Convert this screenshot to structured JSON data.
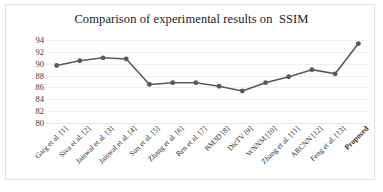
{
  "chart_data": {
    "type": "line",
    "title": "Comparison of experimental results on  SSIM",
    "xlabel": "",
    "ylabel": "",
    "ylim": [
      80,
      94
    ],
    "yticks": [
      94,
      92,
      90,
      88,
      86,
      84,
      82,
      80
    ],
    "grid": true,
    "legend": "none",
    "categories": [
      "Garg et al. [1]",
      "Siva et al. [2]",
      "Jaiswal et al. [3]",
      "Jaiswal et al. [4]",
      "Sun et al. [5]",
      "Zhang et al. [6]",
      "Ren et al. [7]",
      "BM3D [8]",
      "DicTV [9]",
      "WNNM [10]",
      "Zhang et al. [11]",
      "ARCNN [12]",
      "Feng et al. [13]",
      "Proposed"
    ],
    "values": [
      89.7,
      90.5,
      91.0,
      90.8,
      86.5,
      86.8,
      86.8,
      86.2,
      85.4,
      86.8,
      87.8,
      89.0,
      88.3,
      93.4
    ],
    "series_color": "#595959",
    "marker": "circle",
    "highlight_category": "Proposed"
  },
  "figure": {
    "border_color": "#e3e3e3",
    "gridline_color": "#efefef",
    "background": "#ffffff"
  }
}
